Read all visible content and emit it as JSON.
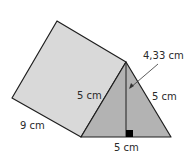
{
  "figure": {
    "type": "triangular prism",
    "labels": {
      "length": "9 cm",
      "left_side": "5 cm",
      "right_side": "5 cm",
      "base": "5 cm",
      "height": "4,33 cm"
    },
    "colors": {
      "side_face": "#d9d9d9",
      "front_face": "#b3b3b3",
      "edge": "#1e1e1e",
      "right_angle_marker": "#000000"
    }
  }
}
